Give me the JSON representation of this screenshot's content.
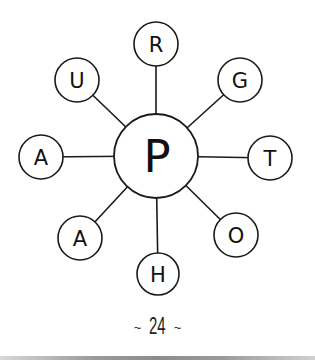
{
  "diagram": {
    "center": {
      "letter": "P",
      "cx": 156,
      "cy": 156,
      "r": 42
    },
    "nodes": [
      {
        "id": "top",
        "letter": "R",
        "cx": 156,
        "cy": 44,
        "r": 22
      },
      {
        "id": "top-right",
        "letter": "G",
        "cx": 240,
        "cy": 80,
        "r": 22
      },
      {
        "id": "right",
        "letter": "T",
        "cx": 270,
        "cy": 158,
        "r": 22
      },
      {
        "id": "bottom-right",
        "letter": "O",
        "cx": 236,
        "cy": 235,
        "r": 22
      },
      {
        "id": "bottom",
        "letter": "H",
        "cx": 158,
        "cy": 274,
        "r": 21
      },
      {
        "id": "bottom-left",
        "letter": "A",
        "cx": 80,
        "cy": 238,
        "r": 22
      },
      {
        "id": "left",
        "letter": "A",
        "cx": 41,
        "cy": 157,
        "r": 22
      },
      {
        "id": "top-left",
        "letter": "U",
        "cx": 77,
        "cy": 80,
        "r": 22
      }
    ],
    "stroke_color": "#1a1a1a",
    "fill_color": "#ffffff"
  },
  "footer": {
    "tilde_left": "~",
    "page_number": "24",
    "tilde_right": "~"
  }
}
